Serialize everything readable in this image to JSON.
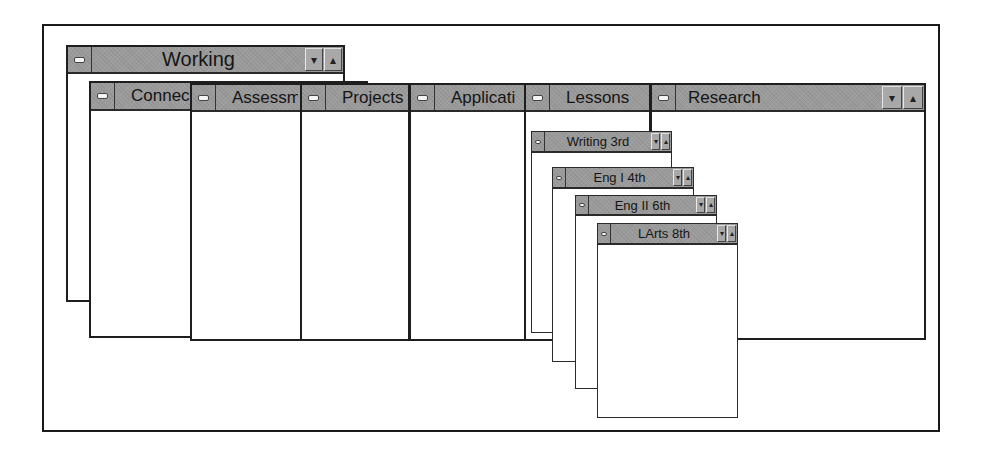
{
  "desktop": {
    "windows": [
      {
        "id": "working",
        "title": "Working",
        "left": 66,
        "top": 45,
        "width": 279,
        "height": 257,
        "title_h": 27,
        "font": 20,
        "has_scroll_buttons": true,
        "title_align": "center"
      },
      {
        "id": "connections",
        "title": "Connections",
        "display_title": "Connec",
        "left": 89,
        "top": 81,
        "width": 279,
        "height": 257,
        "title_h": 28,
        "font": 17,
        "has_scroll_buttons": false,
        "title_align": "center"
      },
      {
        "id": "assessment",
        "title": "Assessment",
        "display_title": "Assessm",
        "left": 190,
        "top": 83,
        "width": 112,
        "height": 258,
        "title_h": 27,
        "font": 17,
        "has_scroll_buttons": false,
        "title_align": "center"
      },
      {
        "id": "projects",
        "title": "Projects",
        "display_title": "Projects",
        "left": 300,
        "top": 83,
        "width": 110,
        "height": 258,
        "title_h": 27,
        "font": 17,
        "has_scroll_buttons": false,
        "title_align": "center"
      },
      {
        "id": "applications",
        "title": "Applications",
        "display_title": "Applicati",
        "left": 409,
        "top": 83,
        "width": 117,
        "height": 258,
        "title_h": 27,
        "font": 17,
        "has_scroll_buttons": false,
        "title_align": "center"
      },
      {
        "id": "lessons",
        "title": "Lessons",
        "display_title": "Lessons",
        "left": 524,
        "top": 83,
        "width": 127,
        "height": 258,
        "title_h": 27,
        "font": 17,
        "has_scroll_buttons": false,
        "title_align": "center"
      },
      {
        "id": "research",
        "title": "Research",
        "left": 650,
        "top": 83,
        "width": 276,
        "height": 257,
        "title_h": 27,
        "font": 17,
        "has_scroll_buttons": true,
        "title_align": "left"
      },
      {
        "id": "writing-3rd",
        "title": "Writing 3rd",
        "left": 531,
        "top": 131,
        "width": 141,
        "height": 202,
        "title_h": 21,
        "font": 13,
        "has_scroll_buttons": true,
        "title_align": "center",
        "thin": true
      },
      {
        "id": "eng-i-4th",
        "title": "Eng I 4th",
        "left": 552,
        "top": 167,
        "width": 142,
        "height": 195,
        "title_h": 21,
        "font": 13,
        "has_scroll_buttons": true,
        "title_align": "center",
        "thin": true
      },
      {
        "id": "eng-ii-6th",
        "title": "Eng II 6th",
        "left": 575,
        "top": 195,
        "width": 142,
        "height": 194,
        "title_h": 20,
        "font": 13,
        "has_scroll_buttons": true,
        "title_align": "center",
        "thin": true
      },
      {
        "id": "larts-8th",
        "title": "LArts 8th",
        "left": 597,
        "top": 223,
        "width": 141,
        "height": 195,
        "title_h": 21,
        "font": 13,
        "has_scroll_buttons": true,
        "title_align": "center",
        "thin": true
      }
    ],
    "icons": {
      "system_menu": "minus-bar",
      "minimize": "▾",
      "maximize": "▴"
    },
    "colors": {
      "titlebar": "#9b9b9b",
      "border": "#1e1e1e",
      "client": "#ffffff"
    }
  }
}
